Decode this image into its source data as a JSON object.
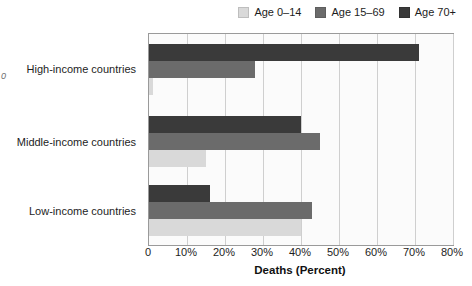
{
  "stray_glyph": "0",
  "legend": {
    "position": "top-right",
    "entries": [
      {
        "label": "Age 0–14",
        "color": "#d9d9d9",
        "icon": "legend-swatch-icon"
      },
      {
        "label": "Age 15–69",
        "color": "#6b6b6b",
        "icon": "legend-swatch-icon"
      },
      {
        "label": "Age 70+",
        "color": "#3a3a3a",
        "icon": "legend-swatch-icon"
      }
    ]
  },
  "axis": {
    "x_tick_labels": [
      "0",
      "10%",
      "20%",
      "30%",
      "40%",
      "50%",
      "60%",
      "70%",
      "80%"
    ],
    "x_label": "Deaths (Percent)"
  },
  "categories": [
    {
      "label": "High-income countries"
    },
    {
      "label": "Middle-income countries"
    },
    {
      "label": "Low-income countries"
    }
  ],
  "chart_data": {
    "type": "bar",
    "orientation": "horizontal",
    "title": "",
    "subtitle": "",
    "xlabel": "Deaths (Percent)",
    "ylabel": "",
    "xlim": [
      0,
      80
    ],
    "xticks": [
      0,
      10,
      20,
      30,
      40,
      50,
      60,
      70,
      80
    ],
    "xtick_labels": [
      "0",
      "10%",
      "20%",
      "30%",
      "40%",
      "50%",
      "60%",
      "70%",
      "80%"
    ],
    "grid": "vertical",
    "legend_position": "top-right",
    "categories": [
      "High-income countries",
      "Middle-income countries",
      "Low-income countries"
    ],
    "series": [
      {
        "name": "Age 70+",
        "color": "#3a3a3a",
        "values": [
          71,
          40,
          16
        ]
      },
      {
        "name": "Age 15–69",
        "color": "#6b6b6b",
        "values": [
          28,
          45,
          43
        ]
      },
      {
        "name": "Age 0–14",
        "color": "#d9d9d9",
        "values": [
          1,
          15,
          40
        ]
      }
    ]
  }
}
